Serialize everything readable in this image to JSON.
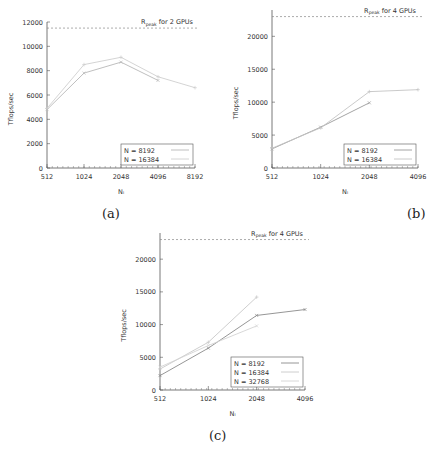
{
  "chart_data": [
    {
      "type": "line",
      "id": "a",
      "caption": "(a)",
      "title": "",
      "xlabel": "Nₗ",
      "ylabel": "Tflops/sec",
      "categories": [
        "512",
        "1024",
        "2048",
        "4096",
        "8192"
      ],
      "ylim": [
        0,
        12000
      ],
      "yticks": [
        0,
        2000,
        4000,
        6000,
        8000,
        10000,
        12000
      ],
      "grid": false,
      "legend_position": "bottom-right",
      "reference_line": {
        "value": 11500,
        "label_main": "R",
        "label_sub": "peak",
        "label_rest": " for 2 GPUs"
      },
      "series": [
        {
          "name": "N = 8192",
          "values": [
            4800,
            7800,
            8700,
            7200,
            null
          ],
          "color": "#b8b8b8",
          "marker": "x"
        },
        {
          "name": "N = 16384",
          "values": [
            4900,
            8500,
            9100,
            7500,
            6600
          ],
          "color": "#cfcfcf",
          "marker": "+"
        }
      ]
    },
    {
      "type": "line",
      "id": "b",
      "caption": "(b)",
      "title": "",
      "xlabel": "Nₗ",
      "ylabel": "Tflops/sec",
      "categories": [
        "512",
        "1024",
        "2048",
        "4096"
      ],
      "ylim": [
        0,
        24000
      ],
      "yticks": [
        0,
        5000,
        10000,
        15000,
        20000
      ],
      "grid": false,
      "legend_position": "bottom-right",
      "reference_line": {
        "value": 23000,
        "label_main": "R",
        "label_sub": "peak",
        "label_rest": " for 4 GPUs"
      },
      "series": [
        {
          "name": "N = 8192",
          "values": [
            2900,
            6200,
            9900,
            null
          ],
          "color": "#9a9a9a",
          "marker": "x"
        },
        {
          "name": "N = 16384",
          "values": [
            3000,
            6100,
            11600,
            11900
          ],
          "color": "#c4c4c4",
          "marker": "+"
        }
      ]
    },
    {
      "type": "line",
      "id": "c",
      "caption": "(c)",
      "title": "",
      "xlabel": "Nₗ",
      "ylabel": "Tflops/sec",
      "categories": [
        "512",
        "1024",
        "2048",
        "4096"
      ],
      "ylim": [
        0,
        24000
      ],
      "yticks": [
        0,
        5000,
        10000,
        15000,
        20000
      ],
      "grid": false,
      "legend_position": "bottom-right",
      "reference_line": {
        "value": 23000,
        "label_main": "R",
        "label_sub": "peak",
        "label_rest": " for 4 GPUs"
      },
      "series": [
        {
          "name": "N = 8192",
          "values": [
            2200,
            6400,
            11400,
            12300
          ],
          "color": "#8a8a8a",
          "marker": "x"
        },
        {
          "name": "N = 16384",
          "values": [
            3200,
            7300,
            14200,
            null
          ],
          "color": "#c8c8c8",
          "marker": "+"
        },
        {
          "name": "N = 32768",
          "values": [
            3500,
            6800,
            9800,
            null
          ],
          "color": "#d4d4d4",
          "marker": "x"
        }
      ]
    }
  ]
}
